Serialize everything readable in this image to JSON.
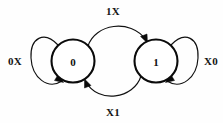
{
  "diagram": {
    "type": "state-transition-diagram",
    "background_color": "#fefefe",
    "stroke_color": "#111111",
    "states": [
      {
        "id": "state-0",
        "label": "0",
        "cx": 73,
        "cy": 61,
        "r": 21.5
      },
      {
        "id": "state-1",
        "label": "1",
        "cx": 156,
        "cy": 61,
        "r": 21.5
      }
    ],
    "transitions": [
      {
        "id": "transition-0-to-1",
        "label": "1X",
        "from": "state-0",
        "to": "state-1",
        "shape": "arc-top",
        "label_x": 113,
        "label_y": 11
      },
      {
        "id": "transition-1-to-0",
        "label": "X1",
        "from": "state-1",
        "to": "state-0",
        "shape": "arc-bottom",
        "label_x": 113,
        "label_y": 112
      },
      {
        "id": "self-loop-0",
        "label": "0X",
        "from": "state-0",
        "to": "state-0",
        "shape": "loop-left",
        "label_x": 15,
        "label_y": 61
      },
      {
        "id": "self-loop-1",
        "label": "X0",
        "from": "state-1",
        "to": "state-1",
        "shape": "loop-right",
        "label_x": 211,
        "label_y": 61
      }
    ]
  }
}
